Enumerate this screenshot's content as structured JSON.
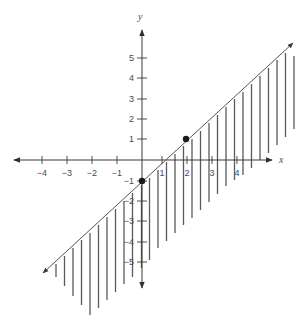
{
  "chart_data": {
    "type": "line",
    "title": "",
    "xlabel": "x",
    "ylabel": "y",
    "xlim": [
      -4,
      5
    ],
    "ylim": [
      -5,
      5
    ],
    "x_ticks": [
      -4,
      -3,
      -2,
      -1,
      1,
      2,
      3,
      4
    ],
    "y_ticks": [
      5,
      4,
      3,
      2,
      1,
      -1,
      -2,
      -3,
      -4,
      -5
    ],
    "grid": false,
    "boundary_line": {
      "equation": "y = x - 1",
      "slope": 1,
      "intercept": -1,
      "style": "solid",
      "arrows": "both ends"
    },
    "points": [
      {
        "x": 0,
        "y": -1,
        "label": "y-intercept"
      },
      {
        "x": 2,
        "y": 1,
        "label": ""
      }
    ],
    "shaded_region": "below the line (y <= x - 1)",
    "shading_style": "vertical hatch lines"
  },
  "render": {
    "colors": {
      "axis": "#3a3a3a",
      "line": "#555555",
      "hatch": "#5a5a5a",
      "point": "#1a1a1a",
      "text": "#4a4a4a"
    },
    "origin": [
      142,
      160
    ],
    "x_tick_px": [
      42,
      67,
      92,
      117,
      162,
      187,
      212,
      237
    ],
    "y_tick_px": [
      58,
      78,
      99,
      119,
      139,
      181,
      201,
      221,
      242,
      262
    ],
    "x_axis": {
      "from": 14,
      "to": 272,
      "label_pos": [
        279,
        163
      ]
    },
    "y_axis": {
      "from": 288,
      "to": 30,
      "label_pos": [
        138,
        20
      ]
    },
    "boundary_px": {
      "from": [
        43,
        273
      ],
      "to": [
        293,
        43
      ]
    },
    "point_px": [
      [
        142,
        181
      ],
      [
        186,
        139
      ]
    ],
    "hatches": [
      [
        56,
        264,
        277
      ],
      [
        64.5,
        256,
        286
      ],
      [
        73,
        248,
        296
      ],
      [
        81.5,
        240,
        305
      ],
      [
        90,
        233,
        315
      ],
      [
        98.5,
        225,
        308
      ],
      [
        107,
        217,
        300
      ],
      [
        115.5,
        209,
        292
      ],
      [
        124,
        201,
        284
      ],
      [
        132.5,
        193,
        277
      ],
      [
        141.5,
        185,
        268
      ],
      [
        149.5,
        178,
        260
      ],
      [
        158,
        170,
        248
      ],
      [
        166.5,
        162,
        241
      ],
      [
        175,
        154,
        233
      ],
      [
        183.5,
        146,
        225
      ],
      [
        192,
        139,
        218
      ],
      [
        200.5,
        131,
        210
      ],
      [
        209,
        123,
        202
      ],
      [
        217.5,
        115,
        194
      ],
      [
        226,
        107,
        186
      ],
      [
        234.5,
        99,
        180
      ],
      [
        243,
        92,
        175
      ],
      [
        251.5,
        84,
        168
      ],
      [
        260,
        76,
        160
      ],
      [
        268.5,
        68,
        153
      ],
      [
        277,
        60,
        145
      ],
      [
        285.5,
        53,
        137
      ],
      [
        294,
        56,
        129
      ]
    ]
  }
}
